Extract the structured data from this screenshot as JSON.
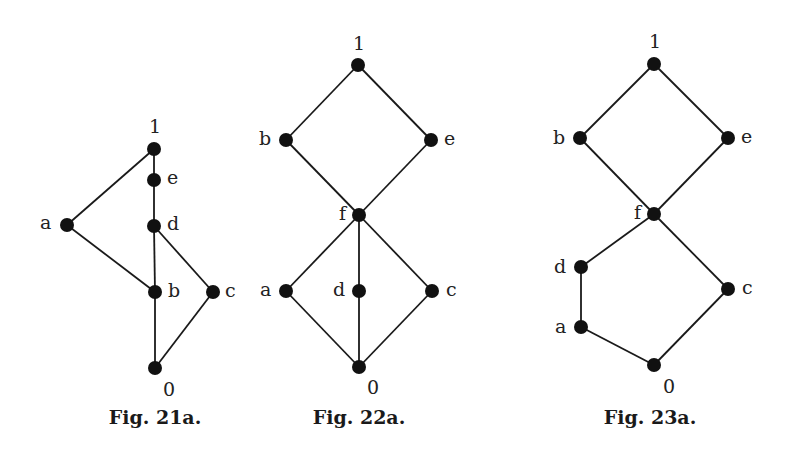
{
  "figures": [
    {
      "id": "fig21a",
      "caption": "Fig. 21a.",
      "caption_pos": [
        155,
        408
      ],
      "nodes": [
        {
          "id": "1",
          "label": "1",
          "x": 154,
          "y": 149,
          "lx": 149,
          "ly": 117
        },
        {
          "id": "e",
          "label": "e",
          "x": 154,
          "y": 180,
          "lx": 167,
          "ly": 168
        },
        {
          "id": "d",
          "label": "d",
          "x": 154,
          "y": 226,
          "lx": 167,
          "ly": 214
        },
        {
          "id": "a",
          "label": "a",
          "x": 67,
          "y": 225,
          "lx": 40,
          "ly": 213
        },
        {
          "id": "b",
          "label": "b",
          "x": 155,
          "y": 292,
          "lx": 168,
          "ly": 281
        },
        {
          "id": "c",
          "label": "c",
          "x": 213,
          "y": 292,
          "lx": 225,
          "ly": 281
        },
        {
          "id": "0",
          "label": "0",
          "x": 155,
          "y": 368,
          "lx": 163,
          "ly": 380
        }
      ],
      "edges": [
        [
          "1",
          "e"
        ],
        [
          "e",
          "d"
        ],
        [
          "d",
          "b"
        ],
        [
          "b",
          "0"
        ],
        [
          "1",
          "a"
        ],
        [
          "a",
          "b"
        ],
        [
          "d",
          "c"
        ],
        [
          "c",
          "0"
        ]
      ]
    },
    {
      "id": "fig22a",
      "caption": "Fig. 22a.",
      "caption_pos": [
        359,
        408
      ],
      "nodes": [
        {
          "id": "1",
          "label": "1",
          "x": 358,
          "y": 65,
          "lx": 353,
          "ly": 34
        },
        {
          "id": "b",
          "label": "b",
          "x": 286,
          "y": 140,
          "lx": 259,
          "ly": 129
        },
        {
          "id": "e",
          "label": "e",
          "x": 431,
          "y": 140,
          "lx": 444,
          "ly": 129
        },
        {
          "id": "f",
          "label": "f",
          "x": 359,
          "y": 215,
          "lx": 339,
          "ly": 204
        },
        {
          "id": "a",
          "label": "a",
          "x": 286,
          "y": 291,
          "lx": 260,
          "ly": 280
        },
        {
          "id": "d",
          "label": "d",
          "x": 359,
          "y": 291,
          "lx": 333,
          "ly": 280
        },
        {
          "id": "c",
          "label": "c",
          "x": 432,
          "y": 291,
          "lx": 446,
          "ly": 280
        },
        {
          "id": "0",
          "label": "0",
          "x": 359,
          "y": 367,
          "lx": 367,
          "ly": 378
        }
      ],
      "edges": [
        [
          "1",
          "b"
        ],
        [
          "1",
          "e"
        ],
        [
          "b",
          "f"
        ],
        [
          "e",
          "f"
        ],
        [
          "f",
          "a"
        ],
        [
          "f",
          "d"
        ],
        [
          "f",
          "c"
        ],
        [
          "a",
          "0"
        ],
        [
          "d",
          "0"
        ],
        [
          "c",
          "0"
        ]
      ]
    },
    {
      "id": "fig23a",
      "caption": "Fig. 23a.",
      "caption_pos": [
        650,
        408
      ],
      "nodes": [
        {
          "id": "1",
          "label": "1",
          "x": 654,
          "y": 64,
          "lx": 649,
          "ly": 32
        },
        {
          "id": "b",
          "label": "b",
          "x": 580,
          "y": 138,
          "lx": 553,
          "ly": 128
        },
        {
          "id": "e",
          "label": "e",
          "x": 728,
          "y": 138,
          "lx": 741,
          "ly": 127
        },
        {
          "id": "f",
          "label": "f",
          "x": 654,
          "y": 214,
          "lx": 634,
          "ly": 203
        },
        {
          "id": "d",
          "label": "d",
          "x": 581,
          "y": 267,
          "lx": 554,
          "ly": 257
        },
        {
          "id": "c",
          "label": "c",
          "x": 728,
          "y": 289,
          "lx": 742,
          "ly": 278
        },
        {
          "id": "a",
          "label": "a",
          "x": 581,
          "y": 327,
          "lx": 555,
          "ly": 317
        },
        {
          "id": "0",
          "label": "0",
          "x": 654,
          "y": 365,
          "lx": 663,
          "ly": 377
        }
      ],
      "edges": [
        [
          "1",
          "b"
        ],
        [
          "1",
          "e"
        ],
        [
          "b",
          "f"
        ],
        [
          "e",
          "f"
        ],
        [
          "f",
          "d"
        ],
        [
          "d",
          "a"
        ],
        [
          "a",
          "0"
        ],
        [
          "f",
          "c"
        ],
        [
          "c",
          "0"
        ]
      ]
    }
  ],
  "style": {
    "node_color": "#111111",
    "edge_color": "#1a1a1a",
    "node_radius": 7
  }
}
